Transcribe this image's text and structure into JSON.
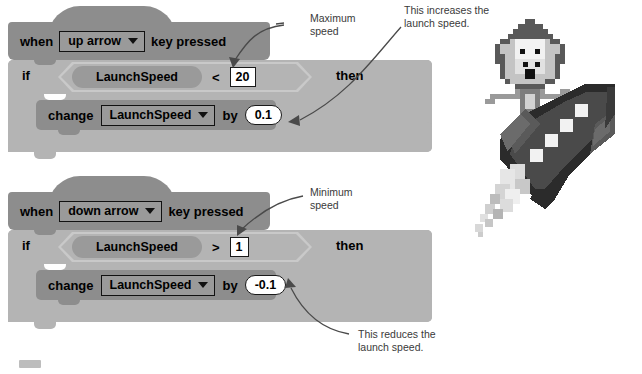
{
  "colors": {
    "hat_block": "#8d8d8d",
    "c_block": "#b4b4b4",
    "reporter_pill": "#9a9a9a",
    "boolean_hex_outline": "#c9c9c9",
    "input_white": "#ffffff",
    "text": "#000000",
    "annotation_text": "#3a3a3a",
    "arrow": "#4a4a4a"
  },
  "scripts": [
    {
      "id": "up-arrow-script",
      "hat": {
        "prefix": "when",
        "dropdown_value": "up arrow",
        "suffix": "key pressed"
      },
      "condition": {
        "if_label": "if",
        "then_label": "then",
        "variable": "LaunchSpeed",
        "operator": "<",
        "value": "20"
      },
      "body": {
        "verb": "change",
        "dropdown_value": "LaunchSpeed",
        "preposition": "by",
        "amount": "0.1"
      }
    },
    {
      "id": "down-arrow-script",
      "hat": {
        "prefix": "when",
        "dropdown_value": "down arrow",
        "suffix": "key pressed"
      },
      "condition": {
        "if_label": "if",
        "then_label": "then",
        "variable": "LaunchSpeed",
        "operator": ">",
        "value": "1"
      },
      "body": {
        "verb": "change",
        "dropdown_value": "LaunchSpeed",
        "preposition": "by",
        "amount": "-0.1"
      }
    }
  ],
  "annotations": [
    {
      "id": "maximum-speed",
      "text": "Maximum\nspeed"
    },
    {
      "id": "increases-speed",
      "text": "This increases the\nlaunch speed."
    },
    {
      "id": "minimum-speed",
      "text": "Minimum\nspeed"
    },
    {
      "id": "reduces-speed",
      "text": "This reduces the\nlaunch speed."
    }
  ],
  "illustration": {
    "name": "monkey-riding-rocket",
    "description": "Pixel-art monkey riding a grey rocket with exhaust smoke"
  }
}
